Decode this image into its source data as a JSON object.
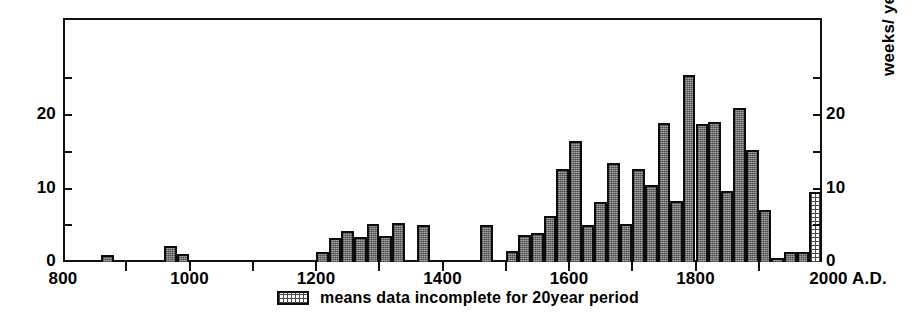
{
  "chart_data": {
    "type": "bar",
    "title": "",
    "subtitle": "",
    "xlabel": "",
    "ylabel": "weeks/ year",
    "ylabel_left": "",
    "xlim": [
      800,
      2000
    ],
    "ylim": [
      0,
      28
    ],
    "grid": false,
    "legend_position": "below-axis",
    "bar_width_years": 20,
    "x_unit": "A.D.",
    "y_tick_values": [
      0,
      5,
      10,
      15,
      20,
      25
    ],
    "y_tick_labels_left": [
      "0",
      "",
      "10",
      "",
      "20",
      ""
    ],
    "y_tick_labels_right": [
      "0",
      "",
      "10",
      "",
      "20",
      ""
    ],
    "x_tick_values": [
      800,
      900,
      1000,
      1100,
      1200,
      1300,
      1400,
      1500,
      1600,
      1700,
      1800,
      1900,
      2000
    ],
    "x_tick_labels": [
      "800",
      "",
      "1000",
      "",
      "1200",
      "",
      "1400",
      "",
      "1600",
      "",
      "1800",
      "",
      "2000 A.D."
    ],
    "colors": {
      "bar_fill": "#8d8d8d",
      "bar_edge": "#0c0c0c",
      "incomplete_fill": "#ffffff",
      "axis": "#111111",
      "background": "#ffffff"
    },
    "categories": [
      860,
      960,
      980,
      1200,
      1220,
      1240,
      1260,
      1280,
      1300,
      1320,
      1360,
      1460,
      1500,
      1520,
      1540,
      1560,
      1580,
      1600,
      1620,
      1640,
      1660,
      1680,
      1700,
      1720,
      1740,
      1760,
      1780,
      1800,
      1820,
      1840,
      1860,
      1880,
      1900,
      1920,
      1940,
      1960,
      1980
    ],
    "values": [
      1,
      2.2,
      1.1,
      1.3,
      3.2,
      4.2,
      3.4,
      5.2,
      3.6,
      5.3,
      5.0,
      5.0,
      1.5,
      3.7,
      4.0,
      6.2,
      12.7,
      16.4,
      5.0,
      8.2,
      13.5,
      5.2,
      12.7,
      10.5,
      18.9,
      8.3,
      25.4,
      18.8,
      19.0,
      9.6,
      20.9,
      15.2,
      7.1,
      0.5,
      1.4,
      1.4,
      9.5
    ],
    "series": [
      {
        "name": "weeks per year (20-year period)",
        "values": [
          1,
          2.2,
          1.1,
          1.3,
          3.2,
          4.2,
          3.4,
          5.2,
          3.6,
          5.3,
          5.0,
          5.0,
          1.5,
          3.7,
          4.0,
          6.2,
          12.7,
          16.4,
          5.0,
          8.2,
          13.5,
          5.2,
          12.7,
          10.5,
          18.9,
          8.3,
          25.4,
          18.8,
          19.0,
          9.6,
          20.9,
          15.2,
          7.1,
          0.5,
          1.4,
          1.4,
          9.5
        ]
      }
    ],
    "incomplete_bars": [
      1980
    ],
    "annotations": []
  },
  "legend": {
    "swatch_name": "dotted-pattern-swatch",
    "text": "means data incomplete for 20year period"
  },
  "axes": {
    "right_title": "weeks/ year"
  }
}
